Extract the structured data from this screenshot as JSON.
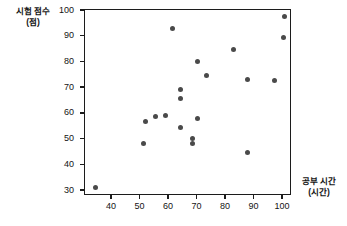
{
  "chart_data": {
    "type": "scatter",
    "title": "",
    "xlabel": "공부 시간",
    "xlabel_unit": "(시간)",
    "ylabel": "시험 점수",
    "ylabel_unit": "(점)",
    "xlim": [
      33,
      105
    ],
    "ylim": [
      28,
      100
    ],
    "xticks": [
      40,
      50,
      60,
      70,
      80,
      90,
      100
    ],
    "yticks": [
      30,
      40,
      50,
      60,
      70,
      80,
      90,
      100
    ],
    "grid": false,
    "legend": null,
    "marker_color": "#4a4a4a",
    "frame_color": "#1c1c1c",
    "points": [
      {
        "x": 34.5,
        "y": 31
      },
      {
        "x": 51.5,
        "y": 48
      },
      {
        "x": 52.0,
        "y": 56.5
      },
      {
        "x": 55.5,
        "y": 58.5
      },
      {
        "x": 59.0,
        "y": 59
      },
      {
        "x": 61.5,
        "y": 93
      },
      {
        "x": 64.5,
        "y": 54.5
      },
      {
        "x": 64.5,
        "y": 65.5
      },
      {
        "x": 64.5,
        "y": 69
      },
      {
        "x": 68.5,
        "y": 48
      },
      {
        "x": 68.5,
        "y": 50
      },
      {
        "x": 70.5,
        "y": 58
      },
      {
        "x": 70.5,
        "y": 80
      },
      {
        "x": 73.5,
        "y": 74.5
      },
      {
        "x": 83.0,
        "y": 84.5
      },
      {
        "x": 88.0,
        "y": 44.5
      },
      {
        "x": 88.0,
        "y": 73
      },
      {
        "x": 97.5,
        "y": 72.5
      },
      {
        "x": 100.5,
        "y": 89.5
      },
      {
        "x": 101.0,
        "y": 97.5
      }
    ]
  }
}
